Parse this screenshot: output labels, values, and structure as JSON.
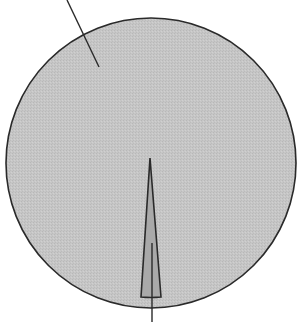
{
  "chart_data": {
    "type": "pie",
    "title": "",
    "slices": [
      {
        "label": "",
        "value": 97.8,
        "color": "#c4c4c4"
      },
      {
        "label": "",
        "value": 2.2,
        "color": "#a8a8a8"
      }
    ],
    "annotations": [
      {
        "target": "large-slice",
        "label": "",
        "line": [
          [
            67,
            0
          ],
          [
            99,
            67
          ]
        ]
      },
      {
        "target": "small-slice",
        "label": "",
        "line": [
          [
            152,
            243
          ],
          [
            152,
            322
          ]
        ]
      }
    ],
    "legend": "none",
    "grid": false
  },
  "geometry": {
    "cx": 151,
    "cy": 163,
    "r": 145,
    "small_slice": {
      "apex": [
        150,
        158
      ],
      "left": [
        141,
        297
      ],
      "right": [
        161,
        297
      ]
    }
  },
  "colors": {
    "large_fill": "#c4c4c4",
    "small_fill": "#a9a9a9",
    "stroke": "#2a2a2a"
  }
}
